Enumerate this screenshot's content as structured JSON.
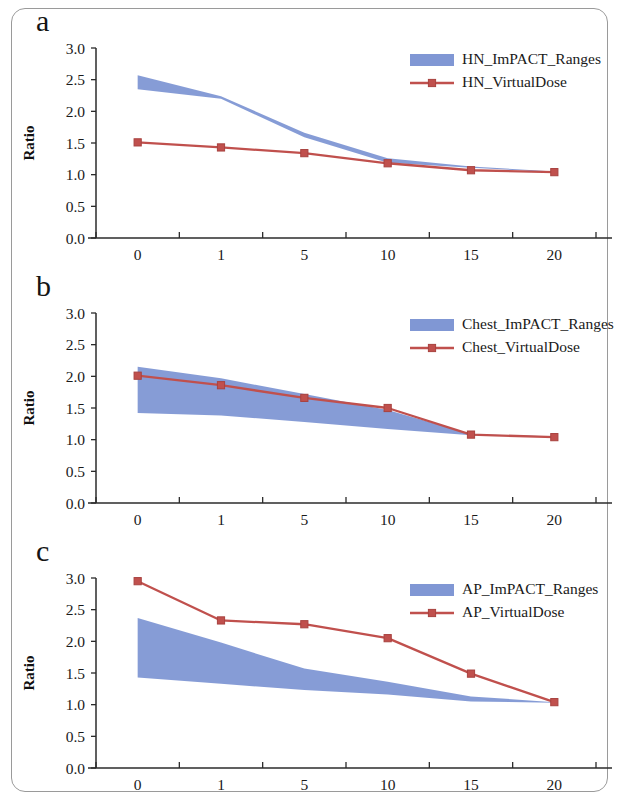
{
  "figure": {
    "panels": [
      {
        "label": "a",
        "ylabel": "Ratio",
        "xlabel": "Age (year)",
        "legend": [
          {
            "name": "HN_ImPACT_Ranges",
            "type": "band",
            "color": "#8097d4"
          },
          {
            "name": "HN_VirtualDose",
            "type": "line",
            "color": "#c0504d"
          }
        ]
      },
      {
        "label": "b",
        "ylabel": "Ratio",
        "xlabel": "Age (year)",
        "legend": [
          {
            "name": "Chest_ImPACT_Ranges",
            "type": "band",
            "color": "#8097d4"
          },
          {
            "name": "Chest_VirtualDose",
            "type": "line",
            "color": "#c0504d"
          }
        ]
      },
      {
        "label": "c",
        "ylabel": "Ratio",
        "xlabel": "Age (year)",
        "legend": [
          {
            "name": "AP_ImPACT_Ranges",
            "type": "band",
            "color": "#8097d4"
          },
          {
            "name": "AP_VirtualDose",
            "type": "line",
            "color": "#c0504d"
          }
        ]
      }
    ]
  },
  "chart_data": [
    {
      "type": "area",
      "panel": "a",
      "title": "",
      "xlabel": "Age (year)",
      "ylabel": "Ratio",
      "categories": [
        "0",
        "1",
        "5",
        "10",
        "15",
        "20"
      ],
      "x": [
        0,
        1,
        5,
        10,
        15,
        20
      ],
      "ylim": [
        0.0,
        3.0
      ],
      "yticks": [
        "0.0",
        "0.5",
        "1.0",
        "1.5",
        "2.0",
        "2.5",
        "3.0"
      ],
      "ytick_values": [
        0.0,
        0.5,
        1.0,
        1.5,
        2.0,
        2.5,
        3.0
      ],
      "grid": false,
      "legend_position": "top-right",
      "series": [
        {
          "name": "HN_ImPACT_Ranges",
          "type": "band",
          "color": "#8097d4",
          "upper": [
            2.57,
            2.24,
            1.66,
            1.26,
            1.13,
            1.05
          ],
          "lower": [
            2.35,
            2.2,
            1.59,
            1.19,
            1.11,
            1.04
          ]
        },
        {
          "name": "HN_VirtualDose",
          "type": "line",
          "color": "#c0504d",
          "marker": "square",
          "values": [
            1.51,
            1.43,
            1.34,
            1.18,
            1.07,
            1.04
          ]
        }
      ]
    },
    {
      "type": "area",
      "panel": "b",
      "title": "",
      "xlabel": "Age (year)",
      "ylabel": "Ratio",
      "categories": [
        "0",
        "1",
        "5",
        "10",
        "15",
        "20"
      ],
      "x": [
        0,
        1,
        5,
        10,
        15,
        20
      ],
      "ylim": [
        0.0,
        3.0
      ],
      "yticks": [
        "0.0",
        "0.5",
        "1.0",
        "1.5",
        "2.0",
        "2.5",
        "3.0"
      ],
      "ytick_values": [
        0.0,
        0.5,
        1.0,
        1.5,
        2.0,
        2.5,
        3.0
      ],
      "grid": false,
      "legend_position": "top-right",
      "series": [
        {
          "name": "Chest_ImPACT_Ranges",
          "type": "band",
          "color": "#8097d4",
          "upper": [
            2.15,
            1.97,
            1.72,
            1.47,
            1.09,
            1.05
          ],
          "lower": [
            1.42,
            1.38,
            1.28,
            1.17,
            1.07,
            1.04
          ]
        },
        {
          "name": "Chest_VirtualDose",
          "type": "line",
          "color": "#c0504d",
          "marker": "square",
          "values": [
            2.01,
            1.86,
            1.66,
            1.5,
            1.08,
            1.04
          ]
        }
      ]
    },
    {
      "type": "area",
      "panel": "c",
      "title": "",
      "xlabel": "Age (year)",
      "ylabel": "Ratio",
      "categories": [
        "0",
        "1",
        "5",
        "10",
        "15",
        "20"
      ],
      "x": [
        0,
        1,
        5,
        10,
        15,
        20
      ],
      "ylim": [
        0.0,
        3.0
      ],
      "yticks": [
        "0.0",
        "0.5",
        "1.0",
        "1.5",
        "2.0",
        "2.5",
        "3.0"
      ],
      "ytick_values": [
        0.0,
        0.5,
        1.0,
        1.5,
        2.0,
        2.5,
        3.0
      ],
      "grid": false,
      "legend_position": "top-right",
      "series": [
        {
          "name": "AP_ImPACT_Ranges",
          "type": "band",
          "color": "#8097d4",
          "upper": [
            2.37,
            1.98,
            1.57,
            1.36,
            1.13,
            1.04
          ],
          "lower": [
            1.43,
            1.33,
            1.23,
            1.16,
            1.05,
            1.03
          ]
        },
        {
          "name": "AP_VirtualDose",
          "type": "line",
          "color": "#c0504d",
          "marker": "square",
          "values": [
            2.95,
            2.33,
            2.27,
            2.05,
            1.49,
            1.04
          ]
        }
      ]
    }
  ]
}
